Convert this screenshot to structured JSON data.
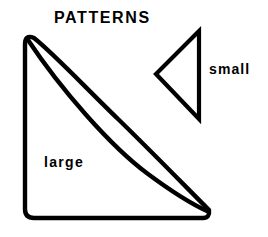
{
  "figure": {
    "title": "PATTERNS",
    "background_color": "#ffffff",
    "stroke_color": "#000000",
    "shapes": [
      {
        "name": "large-pattern",
        "label": "large",
        "description": "right triangle outline with concave curved hypotenuse and rounded corners",
        "stroke_width": 4
      },
      {
        "name": "small-pattern",
        "label": "small",
        "description": "left-pointing triangle outline",
        "stroke_width": 4
      }
    ],
    "labels": {
      "large": "large",
      "small": "small"
    }
  }
}
